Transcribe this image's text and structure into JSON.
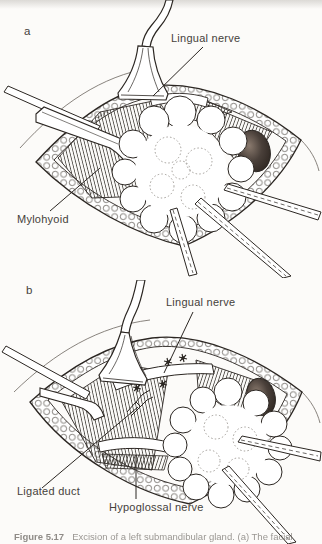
{
  "figure": {
    "panels": [
      {
        "letter": "a",
        "labels": [
          {
            "text": "Lingual nerve"
          },
          {
            "text": "Mylohyoid"
          }
        ]
      },
      {
        "letter": "b",
        "labels": [
          {
            "text": "Lingual nerve"
          },
          {
            "text": "Ligated duct"
          },
          {
            "text": "Hypoglossal nerve"
          }
        ]
      }
    ],
    "caption": {
      "label": "Figure 5.17",
      "text": "Excision of a left submandibular gland. (a) The facial"
    },
    "colors": {
      "ink": "#2b2622",
      "paper": "#fcfbf9",
      "label_text": "#45413b",
      "cavity_dark": "#241d18"
    }
  }
}
